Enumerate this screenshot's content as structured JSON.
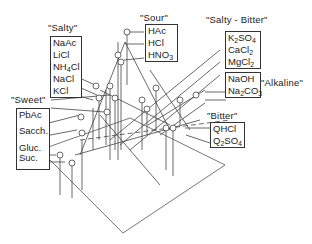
{
  "diagram": {
    "type": "3d taste-space plot with labeled stimuli",
    "groups": [
      {
        "key": "salty",
        "label": "\"Salty\"",
        "items": [
          "NaAc",
          "LiCl",
          "NH4Cl",
          "NaCl",
          "KCl"
        ]
      },
      {
        "key": "sour",
        "label": "\"Sour\"",
        "items": [
          "HAc",
          "HCl",
          "HNO3"
        ]
      },
      {
        "key": "salty_bitter",
        "label": "\"Salty - Bitter\"",
        "items": [
          "K2SO4",
          "CaCl2",
          "MgCl2"
        ]
      },
      {
        "key": "alkaline",
        "label": "\"Alkaline\"",
        "items": [
          "NaOH",
          "Na2CO3"
        ]
      },
      {
        "key": "sweet",
        "label": "\"Sweet\"",
        "items": [
          "PbAc",
          "Sacch.",
          "Gluc.",
          "Suc."
        ]
      },
      {
        "key": "bitter",
        "label": "\"Bitter\"",
        "items": [
          "QHCl",
          "Q2SO4"
        ]
      }
    ]
  },
  "labels": {
    "salty": "\"Salty\"",
    "sour": "\"Sour\"",
    "salty_bitter": "\"Salty - Bitter\"",
    "alkaline": "\"Alkaline\"",
    "sweet": "\"Sweet\"",
    "bitter": "\"Bitter\""
  },
  "items": {
    "naac": "NaAc",
    "licl": "LiCl",
    "nh4": "NH",
    "nh4_sub": "4",
    "nh4_tail": "Cl",
    "nacl": "NaCl",
    "kcl": "KCl",
    "hac": "HAc",
    "hcl": "HCl",
    "hno": "HNO",
    "hno_sub": "3",
    "k2": "K",
    "k2_sub": "2",
    "k2_tail": "SO",
    "k2_sub2": "4",
    "cacl": "CaCl",
    "cacl_sub": "2",
    "mgcl": "MgCl",
    "mgcl_sub": "2",
    "naoh": "NaOH",
    "na2": "Na",
    "na2_sub": "2",
    "na2_tail": "CO",
    "na2_sub2": "3",
    "pbac": "PbAc",
    "sacch": "Sacch.",
    "gluc": "Gluc.",
    "suc": "Suc.",
    "qhcl": "QHCl",
    "q2": "Q",
    "q2_sub": "2",
    "q2_tail": "SO",
    "q2_sub2": "4"
  },
  "colors": {
    "ink": "#333333",
    "background": "#ffffff"
  }
}
